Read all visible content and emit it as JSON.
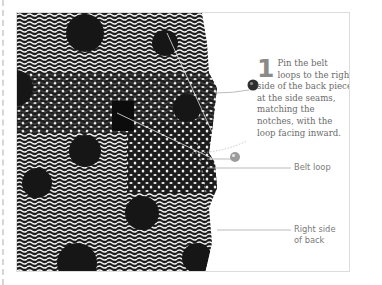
{
  "instruction": {
    "step_number": "1",
    "text": "Pin the belt loops to the right side of the back piece at the side seams, matching the notches, with the loop facing inward."
  },
  "callouts": [
    {
      "label": "Belt loop"
    },
    {
      "label": "Right side of back"
    }
  ],
  "illustration": {
    "subject": "patterned-fabric-back-piece-with-belt-loop",
    "pins": 2,
    "colors": {
      "fabric_dark": "#1a1a1a",
      "fabric_light": "#f2f2f2",
      "pin_head_dark": "#333333",
      "pin_head_light": "#9a9a9a",
      "frame_border": "#dcdcdc",
      "text": "#6b6b6b"
    }
  }
}
